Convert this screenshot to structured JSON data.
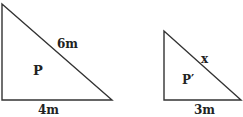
{
  "diagram": {
    "stroke_color": "#333333",
    "triangles": [
      {
        "name": "P",
        "label": "P",
        "hypotenuse_label": "6m",
        "base_label": "4m",
        "vertices": [
          [
            2,
            4
          ],
          [
            2,
            100
          ],
          [
            112,
            100
          ]
        ]
      },
      {
        "name": "P'",
        "label": "P′",
        "hypotenuse_label": "x",
        "base_label": "3m",
        "vertices": [
          [
            164,
            31
          ],
          [
            164,
            100
          ],
          [
            241,
            100
          ]
        ]
      }
    ]
  }
}
